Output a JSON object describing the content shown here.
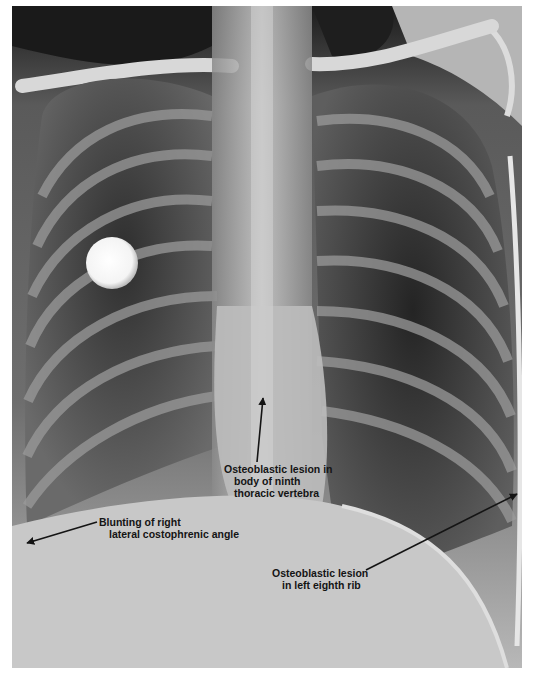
{
  "figure": {
    "type": "chest radiograph (PA view)",
    "annotations": [
      {
        "id": "vertebra",
        "lines": [
          "Osteoblastic lesion in",
          "body of ninth",
          "thoracic vertebra"
        ],
        "arrow": {
          "from": [
            257,
            462
          ],
          "to": [
            263,
            398
          ]
        }
      },
      {
        "id": "costophrenic",
        "lines": [
          "Blunting of right",
          "lateral costophrenic angle"
        ],
        "arrow": {
          "from": [
            97,
            522
          ],
          "to": [
            27,
            543
          ]
        }
      },
      {
        "id": "rib",
        "lines": [
          "Osteoblastic lesion",
          "in left eighth rib"
        ],
        "arrow": {
          "from": [
            366,
            570
          ],
          "to": [
            517,
            494
          ]
        }
      }
    ],
    "colors": {
      "background": "#ffffff",
      "annotation_text": "#141414",
      "lung_dark": "#2a2a2a",
      "soft_tissue": "#c9c9c9",
      "bone": "#e8e8e8"
    }
  }
}
